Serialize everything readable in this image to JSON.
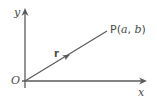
{
  "diagram": {
    "labels": {
      "y_axis": "y",
      "x_axis": "x",
      "origin": "O",
      "vector": "r",
      "point_prefix": "P(",
      "point_a": "a",
      "point_sep": ", ",
      "point_b": "b",
      "point_suffix": ")"
    },
    "colors": {
      "line": "#5a5a5a",
      "text": "#4a4a4a",
      "background": "#ffffff"
    }
  }
}
